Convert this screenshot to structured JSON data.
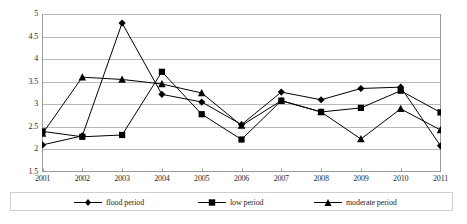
{
  "chart_data": {
    "type": "line",
    "title": "",
    "subtitle": "",
    "xlabel": "",
    "ylabel": "",
    "categories": [
      "2001",
      "2002",
      "2003",
      "2004",
      "2005",
      "2006",
      "2007",
      "2008",
      "2009",
      "2010",
      "2011"
    ],
    "x": [
      2001,
      2002,
      2003,
      2004,
      2005,
      2006,
      2007,
      2008,
      2009,
      2010,
      2011
    ],
    "ylim": [
      1.5,
      5.0
    ],
    "yticks": [
      1.5,
      2,
      2.5,
      3,
      3.5,
      4,
      4.5,
      5
    ],
    "ytick_labels": [
      "1.5",
      "2",
      "2.5",
      "3",
      "3.5",
      "4",
      "4.5",
      "5"
    ],
    "grid": "horizontal",
    "legend_position": "bottom",
    "series": [
      {
        "name": "flood period",
        "marker": "diamond",
        "color": "#000000",
        "values": [
          2.1,
          2.3,
          4.8,
          3.22,
          3.05,
          2.55,
          3.27,
          3.1,
          3.35,
          3.38,
          2.08
        ]
      },
      {
        "name": "low period",
        "marker": "square",
        "color": "#000000",
        "values": [
          2.4,
          2.28,
          2.32,
          3.72,
          2.78,
          2.22,
          3.08,
          2.83,
          2.92,
          3.3,
          2.82
        ]
      },
      {
        "name": "moderate period",
        "marker": "triangle",
        "color": "#000000",
        "values": [
          2.35,
          3.6,
          3.55,
          3.45,
          3.25,
          2.53,
          3.08,
          2.83,
          2.23,
          2.9,
          2.43
        ]
      }
    ]
  },
  "legend": {
    "entries": [
      {
        "label": "flood period",
        "marker": "diamond"
      },
      {
        "label": "low period",
        "marker": "square"
      },
      {
        "label": "moderate period",
        "marker": "triangle"
      }
    ]
  },
  "colors": {
    "series": "#000000",
    "grid": "#b9b9b9",
    "axis": "#9a9a9a",
    "text": "#1f1f1f",
    "background": "#ffffff"
  }
}
